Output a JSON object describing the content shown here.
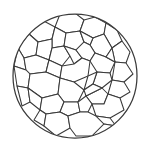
{
  "figure": {
    "kind": "line-art",
    "background_color": "#ffffff",
    "stroke_color": "#3a3a3a",
    "fill_color": "#ffffff",
    "canvas": {
      "width": 150,
      "height": 153
    },
    "outline": {
      "shape": "circle",
      "center_x": 75,
      "center_y": 76,
      "radius": 62,
      "stroke_width": 1.25
    },
    "cell_count": 38,
    "cells": [
      {
        "id": "cell-01",
        "d": "M 60 14 L 75 13 L 84 20 L 80 31 L 66 33 L 55 27 Z"
      },
      {
        "id": "cell-02",
        "d": "M 84 20 L 95 17 L 106 23 L 104 34 L 93 38 L 80 31 Z"
      },
      {
        "id": "cell-03",
        "d": "M 40 19 L 55 27 L 52 39 L 38 42 L 29 34 L 30 25 Z"
      },
      {
        "id": "cell-04",
        "d": "M 55 27 L 66 33 L 64 46 L 52 48 L 52 39 Z"
      },
      {
        "id": "cell-05",
        "d": "M 66 33 L 80 31 L 84 42 L 76 50 L 64 46 Z"
      },
      {
        "id": "cell-06",
        "d": "M 106 23 L 117 30 L 122 41 L 112 48 L 104 34 Z"
      },
      {
        "id": "cell-07",
        "d": "M 93 38 L 104 34 L 112 48 L 106 57 L 95 53 L 90 45 Z"
      },
      {
        "id": "cell-08",
        "d": "M 80 31 L 93 38 L 90 45 L 84 42 Z"
      },
      {
        "id": "cell-09",
        "d": "M 18 48 L 29 34 L 38 42 L 36 55 L 24 58 Z"
      },
      {
        "id": "cell-10",
        "d": "M 38 42 L 52 39 L 52 48 L 49 60 L 36 55 Z"
      },
      {
        "id": "cell-11",
        "d": "M 52 48 L 64 46 L 70 56 L 62 66 L 49 60 Z"
      },
      {
        "id": "cell-12",
        "d": "M 64 46 L 76 50 L 82 58 L 74 64 L 70 56 Z"
      },
      {
        "id": "cell-13",
        "d": "M 76 50 L 84 42 L 90 45 L 95 53 L 90 61 L 82 58 Z"
      },
      {
        "id": "cell-14",
        "d": "M 112 48 L 122 41 L 130 52 L 126 63 L 115 62 Z"
      },
      {
        "id": "cell-15",
        "d": "M 95 53 L 106 57 L 115 62 L 110 73 L 97 72 L 90 61 Z"
      },
      {
        "id": "cell-16",
        "d": "M 106 57 L 112 48 L 115 62 Z"
      },
      {
        "id": "cell-17",
        "d": "M 14 66 L 18 48 L 24 58 L 26 70 Z"
      },
      {
        "id": "cell-18",
        "d": "M 24 58 L 36 55 L 49 60 L 46 72 L 30 74 L 26 70 Z"
      },
      {
        "id": "cell-19",
        "d": "M 49 60 L 62 66 L 60 78 L 46 72 Z"
      },
      {
        "id": "cell-20",
        "d": "M 62 66 L 74 64 L 82 58 L 90 61 L 88 76 L 74 82 L 60 78 Z"
      },
      {
        "id": "cell-21",
        "d": "M 115 62 L 126 63 L 133 74 L 124 82 L 112 80 Z"
      },
      {
        "id": "cell-22",
        "d": "M 97 72 L 110 73 L 112 80 L 102 88 L 93 84 Z"
      },
      {
        "id": "cell-23",
        "d": "M 88 76 L 97 72 L 93 84 L 84 90 Z"
      },
      {
        "id": "cell-24",
        "d": "M 14 66 L 26 70 L 30 74 L 28 88 L 17 86 Z"
      },
      {
        "id": "cell-25",
        "d": "M 30 74 L 46 72 L 60 78 L 58 94 L 42 98 L 28 88 Z"
      },
      {
        "id": "cell-26",
        "d": "M 60 78 L 74 82 L 84 90 L 78 102 L 64 102 L 58 94 Z"
      },
      {
        "id": "cell-27",
        "d": "M 112 80 L 124 82 L 130 92 L 120 98 L 108 94 Z"
      },
      {
        "id": "cell-28",
        "d": "M 102 88 L 108 94 L 104 104 L 92 104 L 86 96 Z"
      },
      {
        "id": "cell-29",
        "d": "M 84 90 L 93 84 L 102 88 L 86 96 Z"
      },
      {
        "id": "cell-30",
        "d": "M 17 86 L 28 88 L 30 102 L 22 106 Z"
      },
      {
        "id": "cell-31",
        "d": "M 28 88 L 42 98 L 40 110 L 30 102 Z"
      },
      {
        "id": "cell-32",
        "d": "M 42 98 L 58 94 L 64 102 L 60 112 L 46 114 L 40 110 Z"
      },
      {
        "id": "cell-33",
        "d": "M 64 102 L 78 102 L 80 112 L 68 116 L 60 112 Z"
      },
      {
        "id": "cell-34",
        "d": "M 78 102 L 86 96 L 92 104 L 88 112 L 80 112 Z"
      },
      {
        "id": "cell-35",
        "d": "M 92 104 L 104 104 L 108 94 L 120 98 L 124 110 L 110 118 L 96 116 Z"
      },
      {
        "id": "cell-36",
        "d": "M 40 110 L 46 114 L 44 126 L 34 120 Z"
      },
      {
        "id": "cell-37",
        "d": "M 46 114 L 60 112 L 68 116 L 70 128 L 56 136 L 44 126 Z"
      },
      {
        "id": "cell-38",
        "d": "M 68 116 L 80 112 L 88 112 L 96 116 L 104 124 L 92 136 L 76 136 L 70 128 Z"
      },
      {
        "id": "cell-39",
        "d": "M 96 116 L 110 118 L 116 126 L 104 124 Z"
      },
      {
        "id": "cell-40",
        "d": "M 104 124 L 116 126 L 108 134 L 92 136 Z"
      }
    ]
  }
}
